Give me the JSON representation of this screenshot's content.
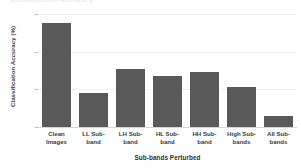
{
  "chart_data": {
    "type": "bar",
    "title": "Classification Accuracy",
    "xlabel": "Sub-bands Perturbed",
    "ylabel": "Classification Accuracy (%)",
    "categories": [
      "Clean Images",
      "LL Sub-band",
      "LH Sub-band",
      "HL Sub-band",
      "HH Sub-band",
      "High Sub-bands",
      "All Sub-bands"
    ],
    "category_lines": [
      "Clean\nImages",
      "LL Sub-\nband",
      "LH Sub-\nband",
      "HL Sub-\nband",
      "HH Sub-\nband",
      "High Sub-\nbands",
      "All Sub-\nbands"
    ],
    "values": [
      95,
      58,
      71,
      67,
      69,
      61,
      46
    ],
    "ylim": [
      40,
      100
    ],
    "yticks": [
      40,
      60,
      80,
      100
    ],
    "ytick_labels": [
      "40",
      "60",
      "80",
      "100"
    ],
    "grid": true,
    "legend": false,
    "bar_color": "#595959",
    "grid_color": "#f1f1f1",
    "axis_color": "#d6d6d6",
    "text_color": "#3b3b3b"
  }
}
